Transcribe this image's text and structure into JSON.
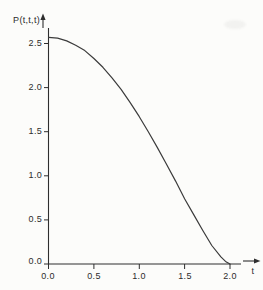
{
  "figure": {
    "background": "#fcfcfa"
  },
  "chart_data": {
    "type": "line",
    "title": "",
    "ylabel": "P(t,t,t)",
    "xlabel": "t",
    "x": [
      0.0,
      0.1,
      0.2,
      0.3,
      0.4,
      0.5,
      0.6,
      0.7,
      0.8,
      0.9,
      1.0,
      1.1,
      1.2,
      1.3,
      1.4,
      1.5,
      1.6,
      1.7,
      1.8,
      1.9,
      1.95,
      2.0
    ],
    "values": [
      2.57,
      2.56,
      2.53,
      2.48,
      2.42,
      2.33,
      2.23,
      2.11,
      1.98,
      1.83,
      1.67,
      1.5,
      1.32,
      1.13,
      0.94,
      0.74,
      0.56,
      0.38,
      0.21,
      0.08,
      0.03,
      0.0
    ],
    "series_name": "P(t,t,t)",
    "xlim": [
      0.0,
      2.12
    ],
    "ylim": [
      0.0,
      2.68
    ],
    "xtick_labels": [
      "0.0",
      "0.5",
      "1.0",
      "1.5",
      "2.0"
    ],
    "ytick_labels": [
      "0.0",
      "0.5",
      "1.0",
      "1.5",
      "2.0",
      "2.5"
    ],
    "grid": false,
    "legend": null,
    "colors": {
      "line": "#3b3b3b",
      "axis": "#2e2e2e",
      "text": "#2c2c2c",
      "background": "#fcfcfa"
    }
  }
}
